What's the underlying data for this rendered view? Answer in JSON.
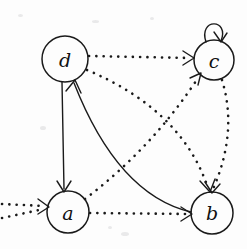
{
  "figure": {
    "background_color": "#fdfdfd",
    "ink_color": "#1a1a1a",
    "width": 247,
    "height": 249
  },
  "graph": {
    "type": "directed-graph",
    "directed": true,
    "node_count": 4,
    "edge_count": 9,
    "nodes": [
      {
        "id": "d",
        "label": "d",
        "cx": 65,
        "cy": 59,
        "r": 23
      },
      {
        "id": "c",
        "label": "c",
        "cx": 214,
        "cy": 60,
        "r": 20
      },
      {
        "id": "a",
        "label": "a",
        "cx": 68,
        "cy": 212,
        "r": 21
      },
      {
        "id": "b",
        "label": "b",
        "cx": 212,
        "cy": 213,
        "r": 21
      }
    ],
    "edges": [
      {
        "id": "e-d-c",
        "from": "d",
        "to": "c",
        "style": "dotted",
        "shape": "straight",
        "arrow_at": "c"
      },
      {
        "id": "e-d-b",
        "from": "d",
        "to": "b",
        "style": "dotted",
        "shape": "curve",
        "arrow_at": "b"
      },
      {
        "id": "e-a-c",
        "from": "a",
        "to": "c",
        "style": "dotted",
        "shape": "curve",
        "arrow_at": "c"
      },
      {
        "id": "e-a-b",
        "from": "a",
        "to": "b",
        "style": "dotted",
        "shape": "straight",
        "arrow_at": "b"
      },
      {
        "id": "e-c-b",
        "from": "c",
        "to": "b",
        "style": "dotted",
        "shape": "curve",
        "arrow_at": "b"
      },
      {
        "id": "e-c-c",
        "from": "c",
        "to": "c",
        "style": "solid",
        "shape": "selfloop",
        "arrow_at": "c"
      },
      {
        "id": "e-d-a",
        "from": "d",
        "to": "a",
        "style": "solid",
        "shape": "straight",
        "arrow_at": "a"
      },
      {
        "id": "e-b-d",
        "from": "b",
        "to": "d",
        "style": "solid",
        "shape": "curve",
        "arrow_at": "d"
      },
      {
        "id": "e-ext-a",
        "from": "external",
        "to": "a",
        "style": "dotted",
        "shape": "straight",
        "arrow_at": "a"
      }
    ]
  }
}
